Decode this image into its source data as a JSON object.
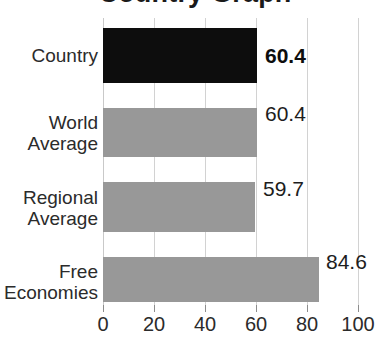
{
  "chart_data": {
    "type": "bar",
    "orientation": "horizontal",
    "title": "Country Graph",
    "title_clipped": true,
    "xlabel": "",
    "ylabel": "",
    "xlim": [
      0,
      100
    ],
    "xticks": [
      0,
      20,
      40,
      60,
      80,
      100
    ],
    "xtick_labels": [
      "0",
      "20",
      "40",
      "60",
      "80",
      "100"
    ],
    "grid": true,
    "grid_axis": "x",
    "legend": false,
    "categories": [
      "Country",
      "World Average",
      "Regional Average",
      "Free Economies"
    ],
    "values": [
      60.4,
      60.4,
      59.7,
      84.6
    ],
    "value_labels": [
      "60.4",
      "60.4",
      "59.7",
      "84.6"
    ],
    "bars": [
      {
        "category": "Country",
        "category_lines": "Country",
        "value": 60.4,
        "value_label": "60.4",
        "color": "#0d0d0d",
        "highlight": true,
        "label_bold": true
      },
      {
        "category": "World Average",
        "category_lines": "World\nAverage",
        "value": 60.4,
        "value_label": "60.4",
        "color": "#989898",
        "highlight": false,
        "label_bold": false
      },
      {
        "category": "Regional Average",
        "category_lines": "Regional\nAverage",
        "value": 59.7,
        "value_label": "59.7",
        "color": "#989898",
        "highlight": false,
        "label_bold": false
      },
      {
        "category": "Free Economies",
        "category_lines": "Free\nEconomies",
        "value": 84.6,
        "value_label": "84.6",
        "color": "#989898",
        "highlight": false,
        "label_bold": false
      }
    ],
    "colors": {
      "highlight_bar": "#0d0d0d",
      "default_bar": "#989898",
      "gridline": "#d2d2d2",
      "text": "#2b2b2b",
      "background": "#ffffff"
    }
  }
}
